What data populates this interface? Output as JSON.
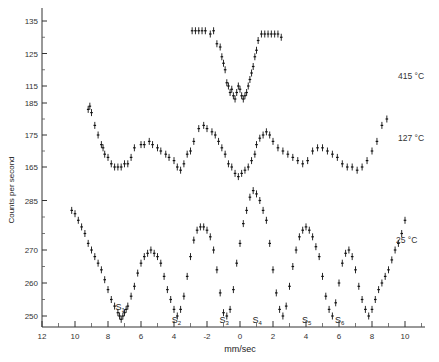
{
  "chart_data": {
    "type": "scatter",
    "title": "",
    "xlabel": "mm/sec",
    "ylabel": "Counts per second",
    "x_tick_labels": [
      "12",
      "10",
      "8",
      "6",
      "4",
      "-2",
      "0",
      "2",
      "4",
      "6",
      "8",
      "10"
    ],
    "x_tick_values": [
      -12,
      -10,
      -8,
      -6,
      -4,
      -2,
      0,
      2,
      4,
      6,
      8,
      10
    ],
    "xlim": [
      -12,
      11
    ],
    "grid": false,
    "legend": null,
    "panels": [
      {
        "name": "415 °C",
        "label": "415 °C",
        "y_ticks": [
          115,
          125,
          135
        ],
        "ylim": [
          112,
          137
        ],
        "series": {
          "x": [
            -2.9,
            -2.7,
            -2.5,
            -2.3,
            -2.1,
            -1.8,
            -1.6,
            -1.4,
            -1.2,
            -1.1,
            -1.0,
            -0.9,
            -0.8,
            -0.7,
            -0.6,
            -0.5,
            -0.4,
            -0.3,
            -0.2,
            -0.1,
            0.0,
            0.1,
            0.2,
            0.3,
            0.4,
            0.5,
            0.6,
            0.7,
            0.8,
            0.9,
            1.0,
            1.1,
            1.3,
            1.5,
            1.7,
            1.9,
            2.1,
            2.3,
            2.5
          ],
          "y": [
            132,
            132,
            132,
            132,
            132,
            131,
            132,
            128,
            127,
            124,
            122,
            120,
            116,
            115,
            113,
            114,
            112,
            111,
            113,
            115,
            114,
            112,
            111,
            112,
            113,
            115,
            117,
            119,
            121,
            124,
            126,
            129,
            131,
            131,
            131,
            131,
            131,
            131,
            130
          ]
        }
      },
      {
        "name": "127 °C",
        "label": "127 °C",
        "y_ticks": [
          165,
          175,
          185
        ],
        "ylim": [
          160,
          187
        ],
        "series": {
          "x": [
            -9.2,
            -9.1,
            -9.0,
            -8.8,
            -8.6,
            -8.4,
            -8.3,
            -8.2,
            -8.0,
            -7.8,
            -7.6,
            -7.4,
            -7.2,
            -7.0,
            -6.8,
            -6.6,
            -6.4,
            -6.0,
            -5.8,
            -5.5,
            -5.3,
            -5.0,
            -4.8,
            -4.5,
            -4.3,
            -4.0,
            -3.8,
            -3.6,
            -3.4,
            -3.2,
            -3.0,
            -2.8,
            -2.5,
            -2.2,
            -2.0,
            -1.7,
            -1.5,
            -1.3,
            -1.1,
            -0.9,
            -0.7,
            -0.5,
            -0.3,
            -0.1,
            0.1,
            0.3,
            0.5,
            0.7,
            0.9,
            1.0,
            1.2,
            1.4,
            1.6,
            1.8,
            2.0,
            2.3,
            2.6,
            2.9,
            3.2,
            3.5,
            3.8,
            4.1,
            4.4,
            4.7,
            5.0,
            5.3,
            5.6,
            5.9,
            6.2,
            6.5,
            6.8,
            7.1,
            7.4,
            7.7,
            8.0,
            8.3,
            8.6,
            8.9
          ],
          "y": [
            183,
            184,
            182,
            178,
            175,
            172,
            171,
            169,
            168,
            166,
            165,
            165,
            165,
            166,
            166,
            168,
            171,
            172,
            172,
            173,
            172,
            171,
            170,
            169,
            168,
            167,
            165,
            164,
            166,
            169,
            170,
            173,
            177,
            178,
            177,
            176,
            175,
            173,
            171,
            169,
            166,
            165,
            163,
            162,
            163,
            164,
            165,
            167,
            169,
            172,
            174,
            175,
            176,
            175,
            173,
            171,
            170,
            169,
            168,
            167,
            166,
            167,
            170,
            171,
            171,
            170,
            169,
            168,
            166,
            165,
            165,
            164,
            165,
            167,
            170,
            173,
            178,
            180
          ]
        }
      },
      {
        "name": "25 °C",
        "label": "25 °C",
        "y_ticks": [
          250,
          260,
          270,
          285
        ],
        "ylim": [
          247,
          288
        ],
        "series": {
          "x": [
            -10.2,
            -10.0,
            -9.8,
            -9.6,
            -9.4,
            -9.2,
            -9.0,
            -8.8,
            -8.6,
            -8.4,
            -8.2,
            -8.0,
            -7.8,
            -7.6,
            -7.4,
            -7.3,
            -7.2,
            -7.1,
            -7.0,
            -6.9,
            -6.8,
            -6.6,
            -6.4,
            -6.2,
            -6.0,
            -5.8,
            -5.6,
            -5.4,
            -5.2,
            -5.0,
            -4.8,
            -4.6,
            -4.4,
            -4.2,
            -4.0,
            -3.8,
            -3.6,
            -3.4,
            -3.2,
            -3.0,
            -2.8,
            -2.6,
            -2.4,
            -2.2,
            -2.0,
            -1.8,
            -1.6,
            -1.4,
            -1.2,
            -1.0,
            -0.8,
            -0.6,
            -0.4,
            -0.2,
            0.0,
            0.2,
            0.4,
            0.6,
            0.8,
            1.0,
            1.2,
            1.4,
            1.6,
            1.8,
            2.0,
            2.2,
            2.4,
            2.6,
            2.8,
            3.0,
            3.2,
            3.4,
            3.6,
            3.8,
            4.0,
            4.2,
            4.4,
            4.6,
            4.8,
            5.0,
            5.2,
            5.4,
            5.6,
            5.8,
            6.0,
            6.2,
            6.4,
            6.6,
            6.8,
            7.0,
            7.2,
            7.4,
            7.6,
            7.8,
            8.0,
            8.2,
            8.4,
            8.6,
            8.8,
            9.0,
            9.2,
            9.4,
            9.6,
            9.8,
            10.0
          ],
          "y": [
            282,
            281,
            279,
            277,
            275,
            272,
            270,
            268,
            266,
            264,
            261,
            258,
            255,
            253,
            251,
            250,
            249,
            250,
            251,
            252,
            253,
            256,
            259,
            263,
            266,
            268,
            269,
            270,
            269,
            268,
            266,
            262,
            258,
            255,
            252,
            250,
            252,
            256,
            262,
            268,
            273,
            276,
            277,
            277,
            276,
            274,
            270,
            264,
            257,
            251,
            250,
            252,
            258,
            266,
            272,
            278,
            282,
            286,
            288,
            287,
            285,
            282,
            279,
            272,
            264,
            257,
            252,
            250,
            253,
            259,
            265,
            270,
            274,
            276,
            277,
            276,
            274,
            271,
            268,
            262,
            256,
            252,
            250,
            254,
            260,
            266,
            269,
            270,
            268,
            264,
            259,
            255,
            252,
            250,
            252,
            255,
            258,
            260,
            262,
            264,
            267,
            270,
            272,
            275,
            279
          ]
        },
        "annotations": [
          {
            "text": "S1",
            "x": -7.3,
            "y": 253
          },
          {
            "text": "S2",
            "x": -3.9,
            "y": 249
          },
          {
            "text": "S3",
            "x": -1.0,
            "y": 249
          },
          {
            "text": "S4",
            "x": 1.0,
            "y": 249
          },
          {
            "text": "S5",
            "x": 4.0,
            "y": 249
          },
          {
            "text": "S6",
            "x": 6.0,
            "y": 249
          }
        ]
      }
    ]
  },
  "labels": {
    "xlabel": "mm/sec",
    "ylabel": "Counts per second",
    "temp_415": "415 °C",
    "temp_127": "127 °C",
    "temp_25": "25 °C"
  }
}
